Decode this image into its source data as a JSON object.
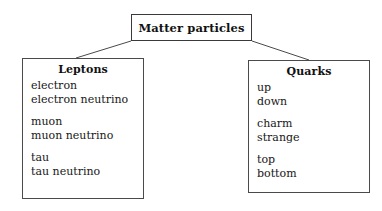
{
  "diagram": {
    "type": "hierarchy-tree",
    "root": {
      "label": "Matter particles"
    },
    "connectors": [
      {
        "name": "root-to-leptons",
        "from_x": 131,
        "from_y": 41,
        "to_x": 76,
        "to_y": 58
      },
      {
        "name": "root-to-quarks",
        "from_x": 252,
        "from_y": 41,
        "to_x": 309,
        "to_y": 60
      }
    ],
    "categories": [
      {
        "id": "leptons",
        "title": "Leptons",
        "groups": [
          {
            "generation": 1,
            "items": [
              "electron",
              "electron neutrino"
            ]
          },
          {
            "generation": 2,
            "items": [
              "muon",
              "muon neutrino"
            ]
          },
          {
            "generation": 3,
            "items": [
              "tau",
              "tau neutrino"
            ]
          }
        ]
      },
      {
        "id": "quarks",
        "title": "Quarks",
        "groups": [
          {
            "generation": 1,
            "items": [
              "up",
              "down"
            ]
          },
          {
            "generation": 2,
            "items": [
              "charm",
              "strange"
            ]
          },
          {
            "generation": 3,
            "items": [
              "top",
              "bottom"
            ]
          }
        ]
      }
    ],
    "colors": {
      "background": "#ffffff",
      "box_border": "#3a3a3a",
      "text": "#111111",
      "line": "#4a4a4a"
    }
  }
}
